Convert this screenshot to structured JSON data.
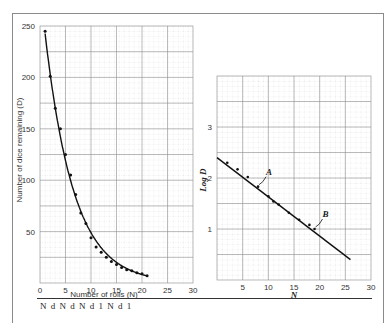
{
  "chart_data": [
    {
      "type": "scatter",
      "title": "",
      "xlabel": "Number of rolls (N)",
      "ylabel": "Number of dice remaining (D)",
      "xlim": [
        0,
        30
      ],
      "ylim": [
        0,
        250
      ],
      "x_ticks": [
        "0",
        "5",
        "10",
        "15",
        "20",
        "25",
        "30"
      ],
      "y_ticks": [
        "50",
        "100",
        "150",
        "200",
        "250"
      ],
      "grid": true,
      "fit": "exponential decay curve",
      "series": [
        {
          "name": "Dice remaining",
          "x": [
            1,
            2,
            3,
            4,
            5,
            6,
            7,
            8,
            9,
            10,
            11,
            12,
            13,
            14,
            15,
            16,
            17,
            18,
            19,
            20,
            21
          ],
          "values": [
            245,
            201,
            170,
            150,
            125,
            105,
            86,
            68,
            58,
            44,
            35,
            30,
            25,
            21,
            18,
            15,
            13,
            12,
            10,
            9,
            7
          ]
        }
      ]
    },
    {
      "type": "line",
      "title": "",
      "xlabel": "N",
      "ylabel": "Log D",
      "xlim": [
        0,
        30
      ],
      "ylim": [
        0,
        3.6
      ],
      "x_ticks": [
        "5",
        "10",
        "15",
        "20",
        "25",
        "30"
      ],
      "y_ticks": [
        "1",
        "2",
        "3"
      ],
      "grid": true,
      "series": [
        {
          "name": "Log D fit",
          "x": [
            0,
            26
          ],
          "values": [
            2.4,
            0.4
          ]
        },
        {
          "name": "Log D points",
          "x": [
            2,
            4,
            6,
            8,
            10,
            11,
            12,
            14,
            16,
            18,
            19
          ],
          "values": [
            2.3,
            2.17,
            2.02,
            1.83,
            1.64,
            1.54,
            1.48,
            1.32,
            1.18,
            1.08,
            1.0
          ]
        }
      ],
      "annotations": [
        {
          "label": "A",
          "x": 8,
          "y": 1.83
        },
        {
          "label": "B",
          "x": 19,
          "y": 1.0
        }
      ]
    }
  ],
  "left": {
    "ylabel": "Number of dice remaining (D)",
    "xlabel": "Number of rolls (N)",
    "x_ticks": [
      "0",
      "5",
      "10",
      "15",
      "20",
      "25",
      "30"
    ],
    "y_ticks": [
      "250",
      "200",
      "150",
      "100",
      "50"
    ]
  },
  "right": {
    "ylabel": "Log D",
    "xlabel": "N",
    "x_ticks": [
      "5",
      "10",
      "15",
      "20",
      "25",
      "30"
    ],
    "y_ticks": [
      "3",
      "2",
      "1"
    ],
    "annotation_a": "A",
    "annotation_b": "B"
  },
  "footer": {
    "partial_text": "N    d      N    d      N    d    1   N    d    1"
  }
}
